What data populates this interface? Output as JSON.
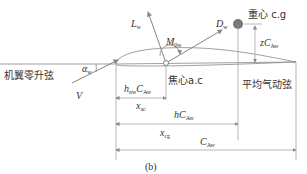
{
  "diagram": {
    "caption": "(b)",
    "labels": {
      "zero_lift_chord": "机翼零升弦",
      "alpha": "α",
      "alpha_sub": "w",
      "velocity": "V",
      "lift": "L",
      "lift_sub": "w",
      "moment": "M",
      "moment_sub": "0w",
      "drag": "D",
      "drag_sub": "w",
      "center_of_gravity": "重心 c.g",
      "z_c": "zC",
      "z_c_sub": "Aw",
      "aerodynamic_center": "焦心a.c",
      "mean_aero_chord": "平均气动弦",
      "h_nw_c": "h",
      "h_nw_sub": "nw",
      "h_nw_c2": "C",
      "h_nw_c2_sub": "Aw",
      "x_ac": "x",
      "x_ac_sub": "ac",
      "h_c": "hC",
      "h_c_sub": "Aw",
      "x_cg": "x",
      "x_cg_sub": "cg",
      "chord": "C",
      "chord_sub": "Aw"
    },
    "colors": {
      "line": "#888888",
      "text": "#333333",
      "cg_dot": "#777777"
    }
  }
}
